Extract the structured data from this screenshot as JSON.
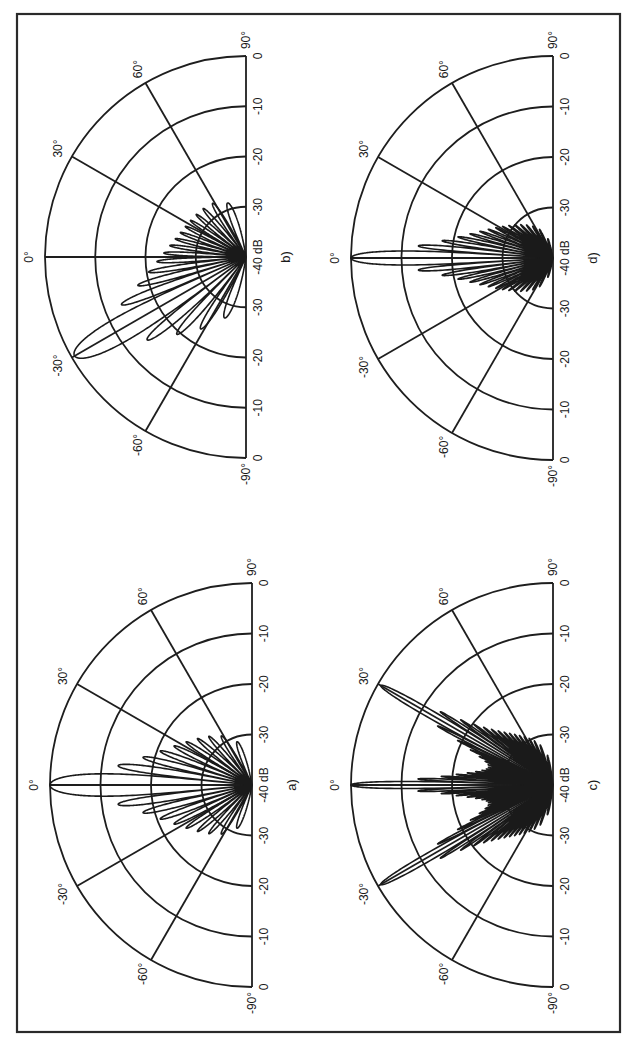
{
  "figure": {
    "orientation": "rotated -90 degrees (page in landscape)",
    "frame_color": "#2a2a2a",
    "line_color": "#1a1a1a",
    "background": "#ffffff"
  },
  "axes": {
    "angle_labels": [
      "-90°",
      "-60°",
      "-30°",
      "0°",
      "30°",
      "60°",
      "90°"
    ],
    "radial_labels_left": [
      "0",
      "-10",
      "-20",
      "-30"
    ],
    "center_label": "-40 dB",
    "radial_labels_right": [
      "-30",
      "-20",
      "-10",
      "0"
    ]
  },
  "panels": [
    {
      "id": "a",
      "label": "a)",
      "cx": 252,
      "cy": 785,
      "r": 202
    },
    {
      "id": "b",
      "label": "b)",
      "cx": 246,
      "cy": 257,
      "r": 201
    },
    {
      "id": "c",
      "label": "c)",
      "cx": 553,
      "cy": 785,
      "r": 202
    },
    {
      "id": "d",
      "label": "d)",
      "cx": 553,
      "cy": 258,
      "r": 202
    }
  ],
  "chart_data": [
    {
      "type": "polar",
      "title": "a)",
      "description": "Array radiation pattern, single beam steered to 0°",
      "theta_range_deg": [
        -90,
        90
      ],
      "r_range_db": [
        -40,
        0
      ],
      "r_ticks_db": [
        0,
        -10,
        -20,
        -30,
        -40
      ],
      "theta_ticks_deg": [
        -90,
        -60,
        -30,
        0,
        30,
        60,
        90
      ],
      "beams_deg": [
        0
      ],
      "main_lobe_db": 0,
      "first_sidelobe_db": -17,
      "far_sidelobe_db": -27,
      "model": {
        "elements": 20,
        "spacing_wl": 0.5,
        "taper": "uniform",
        "element_pattern_cos_power": 1
      }
    },
    {
      "type": "polar",
      "title": "b)",
      "description": "Array radiation pattern, single beam steered to -30°",
      "theta_range_deg": [
        -90,
        90
      ],
      "r_range_db": [
        -40,
        0
      ],
      "r_ticks_db": [
        0,
        -10,
        -20,
        -30,
        -40
      ],
      "theta_ticks_deg": [
        -90,
        -60,
        -30,
        0,
        30,
        60,
        90
      ],
      "beams_deg": [
        -30
      ],
      "main_lobe_db": 0,
      "first_sidelobe_db": -14,
      "far_sidelobe_db": -27,
      "model": {
        "elements": 20,
        "spacing_wl": 0.5,
        "taper": "uniform",
        "element_pattern_cos_power": 1
      }
    },
    {
      "type": "polar",
      "title": "c)",
      "description": "Multi-beam pattern with three beams at -30°, 0° and 30°",
      "theta_range_deg": [
        -90,
        90
      ],
      "r_range_db": [
        -40,
        0
      ],
      "r_ticks_db": [
        0,
        -10,
        -20,
        -30,
        -40
      ],
      "theta_ticks_deg": [
        -90,
        -60,
        -30,
        0,
        30,
        60,
        90
      ],
      "beams_deg": [
        -30,
        0,
        30
      ],
      "main_lobe_db": 0,
      "first_sidelobe_db": -22,
      "far_sidelobe_db": -30,
      "model": {
        "elements": 64,
        "spacing_wl": 0.5,
        "taper": "uniform",
        "element_pattern_cos_power": 1
      }
    },
    {
      "type": "polar",
      "title": "d)",
      "description": "Array radiation pattern, single beam steered to 0°, larger array",
      "theta_range_deg": [
        -90,
        90
      ],
      "r_range_db": [
        -40,
        0
      ],
      "r_ticks_db": [
        0,
        -10,
        -20,
        -30,
        -40
      ],
      "theta_ticks_deg": [
        -90,
        -60,
        -30,
        0,
        30,
        60,
        90
      ],
      "beams_deg": [
        0
      ],
      "main_lobe_db": 0,
      "first_sidelobe_db": -17,
      "far_sidelobe_db": -28,
      "model": {
        "elements": 32,
        "spacing_wl": 0.5,
        "taper": "uniform",
        "element_pattern_cos_power": 1
      }
    }
  ]
}
